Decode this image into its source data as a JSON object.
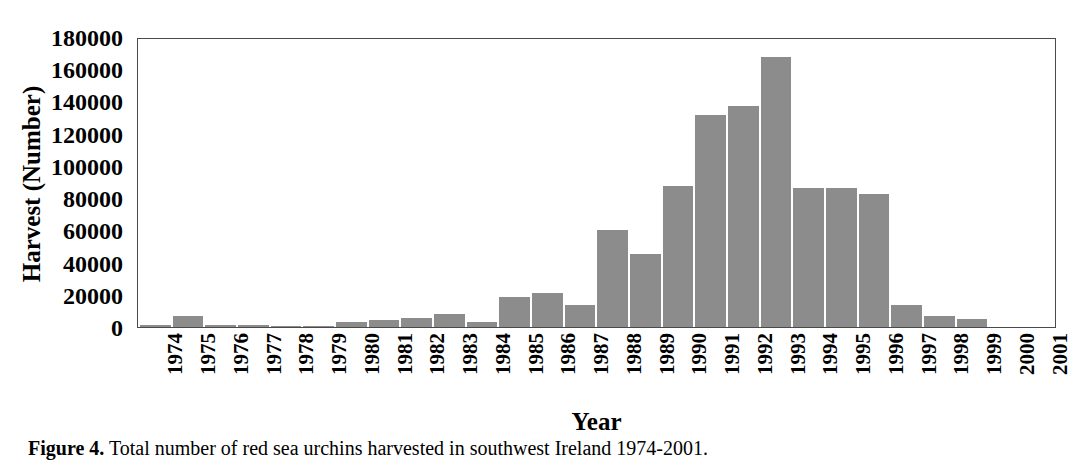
{
  "chart_data": {
    "type": "bar",
    "title": "",
    "xlabel": "Year",
    "ylabel": "Harvest (Number)",
    "ylim": [
      0,
      180000
    ],
    "ytick_values": [
      0,
      20000,
      40000,
      60000,
      80000,
      100000,
      120000,
      140000,
      160000,
      180000
    ],
    "ytick_labels": [
      "0",
      "20000",
      "40000",
      "60000",
      "80000",
      "100000",
      "120000",
      "140000",
      "160000",
      "180000"
    ],
    "grid": false,
    "legend": null,
    "bar_color": "#8c8c8c",
    "axis_color": "#4a4a4a",
    "categories": [
      "1974",
      "1975",
      "1976",
      "1977",
      "1978",
      "1979",
      "1980",
      "1981",
      "1982",
      "1983",
      "1984",
      "1985",
      "1986",
      "1987",
      "1988",
      "1989",
      "1990",
      "1991",
      "1992",
      "1993",
      "1994",
      "1995",
      "1996",
      "1997",
      "1998",
      "1999",
      "2000",
      "2001"
    ],
    "values": [
      2000,
      7500,
      2000,
      2000,
      1500,
      1500,
      4000,
      5000,
      6000,
      8500,
      3500,
      19000,
      22000,
      14500,
      61000,
      46000,
      88000,
      132000,
      138000,
      168000,
      87000,
      87000,
      83000,
      14000,
      7500,
      5500,
      0,
      0
    ]
  },
  "caption": {
    "label": "Figure 4.",
    "text": "Total number of red sea urchins harvested in southwest Ireland 1974-2001."
  }
}
